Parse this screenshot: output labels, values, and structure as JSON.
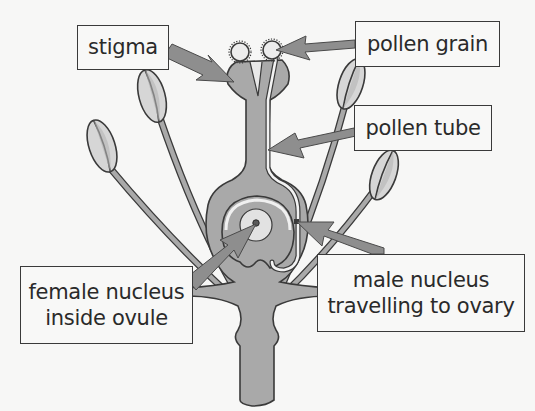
{
  "diagram": {
    "colors": {
      "background": "#f7f7f6",
      "tissue_fill": "#a9a9a9",
      "anther_fill": "#d6d6d6",
      "outline": "#3a3a3a",
      "arrow_fill": "#8e8e8e",
      "label_border": "#3a3a3a",
      "label_text": "#2a2a2a"
    },
    "labels": [
      {
        "id": "stigma",
        "lines": [
          "stigma"
        ],
        "points_to": "stigma"
      },
      {
        "id": "pollen-grain",
        "lines": [
          "pollen grain"
        ],
        "points_to": "pollen grain on stigma"
      },
      {
        "id": "pollen-tube",
        "lines": [
          "pollen tube"
        ],
        "points_to": "pollen tube growing down style"
      },
      {
        "id": "female-nucleus",
        "lines": [
          "female nucleus",
          "inside ovule"
        ],
        "points_to": "female nucleus in ovule"
      },
      {
        "id": "male-nucleus",
        "lines": [
          "male nucleus",
          "travelling to ovary"
        ],
        "points_to": "male nucleus at end of pollen tube"
      }
    ]
  }
}
